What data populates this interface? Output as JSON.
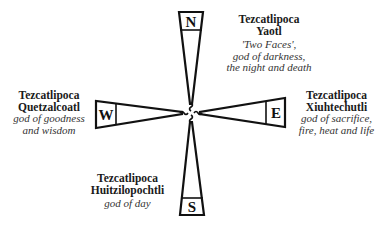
{
  "diagram": {
    "type": "compass-directions",
    "directions": [
      {
        "letter": "N",
        "name1": "Tezcatlipoca",
        "name2": "Yaotl",
        "desc": [
          "'Two Faces',",
          "god of darkness,",
          "the night and death"
        ]
      },
      {
        "letter": "E",
        "name1": "Tezcatlipoca",
        "name2": "Xiuhtechutli",
        "desc": [
          "god of sacrifice,",
          "fire, heat and life"
        ]
      },
      {
        "letter": "S",
        "name1": "Tezcatlipoca",
        "name2": "Huitzilopochtli",
        "desc": [
          "god of day"
        ]
      },
      {
        "letter": "W",
        "name1": "Tezcatlipoca",
        "name2": "Quetzalcoatl",
        "desc": [
          "god of goodness",
          "and wisdom"
        ]
      }
    ],
    "colors": {
      "stroke": "#111111",
      "background": "#ffffff",
      "text": "#1a1a1a"
    }
  }
}
